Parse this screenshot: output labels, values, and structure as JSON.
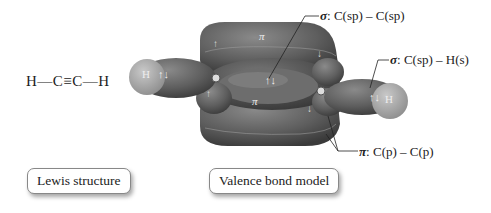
{
  "lewis": {
    "formula": "H—C≡C—H"
  },
  "model": {
    "atoms": {
      "left_h": "H",
      "right_h": "H"
    },
    "pi_symbols": [
      "π",
      "π"
    ],
    "electron_pairs": [
      "↑↓",
      "↑↓",
      "↑↓"
    ],
    "single_arrows": [
      "↑",
      "↓",
      "↓",
      "↑"
    ]
  },
  "labels": {
    "sigma_cc": {
      "symbol": "σ",
      "text": ": C(sp) – C(sp)"
    },
    "sigma_ch": {
      "symbol": "σ",
      "text": ": C(sp) – H(s)"
    },
    "pi_cc": {
      "symbol": "π",
      "text": ": C(p) – C(p)"
    }
  },
  "captions": {
    "lewis": "Lewis structure",
    "valence": "Valence bond model"
  }
}
